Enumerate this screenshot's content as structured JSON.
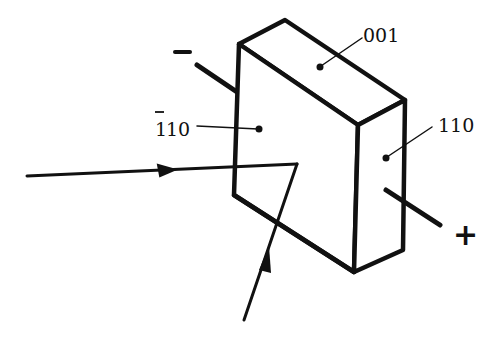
{
  "diagram": {
    "type": "crystal-electro-optic-setup",
    "crystal": {
      "faces": [
        {
          "id": "top",
          "label": "001"
        },
        {
          "id": "front",
          "label": "ť1̄10"
        },
        {
          "id": "side",
          "label": "110"
        }
      ],
      "front_label_bar": "1",
      "front_label_rest": "10"
    },
    "electrodes": {
      "negative_label": "–",
      "positive_label": "+"
    },
    "beams": [
      {
        "id": "incident-horizontal",
        "description": "beam entering from left"
      },
      {
        "id": "incident-bottom",
        "description": "beam entering from below"
      }
    ],
    "colors": {
      "stroke": "#111111",
      "background": "#ffffff"
    }
  }
}
